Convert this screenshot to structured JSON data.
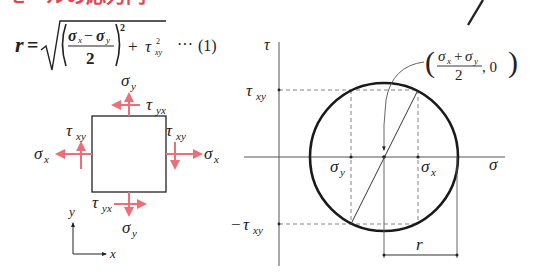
{
  "heading": {
    "text": "モールの応力円",
    "color": "#e0474f",
    "cropped": true
  },
  "formula": {
    "lhs": "r",
    "equals": "=",
    "numerator_a": "σ",
    "numerator_a_sub": "x",
    "minus": "−",
    "numerator_b": "σ",
    "numerator_b_sub": "y",
    "denominator": "2",
    "exponent": "2",
    "plus": "+",
    "tau": "τ",
    "tau_sub": "xy",
    "tau_exp": "2",
    "dots": "···",
    "number": "(1)"
  },
  "stress_element": {
    "arrow_color": "#ec6f78",
    "labels": {
      "top_normal": {
        "sym": "σ",
        "sub": "y"
      },
      "top_shear": {
        "sym": "τ",
        "sub": "yx"
      },
      "left_shear": {
        "sym": "τ",
        "sub": "xy"
      },
      "left_normal": {
        "sym": "σ",
        "sub": "x"
      },
      "right_shear": {
        "sym": "τ",
        "sub": "xy"
      },
      "right_normal": {
        "sym": "σ",
        "sub": "x"
      },
      "bottom_shear": {
        "sym": "τ",
        "sub": "yx"
      },
      "bottom_normal": {
        "sym": "σ",
        "sub": "y"
      }
    },
    "axes": {
      "y_label": "y",
      "x_label": "x"
    }
  },
  "mohr_circle": {
    "axis_labels": {
      "vertical": "τ",
      "horizontal": "σ"
    },
    "tick_labels": {
      "tau_pos": {
        "sym": "τ",
        "sub": "xy"
      },
      "tau_neg": {
        "prefix": "−",
        "sym": "τ",
        "sub": "xy"
      },
      "sigma_y": {
        "sym": "σ",
        "sub": "y"
      },
      "sigma_x": {
        "sym": "σ",
        "sub": "x"
      }
    },
    "center_label": {
      "open": "(",
      "num_a": "σ",
      "num_a_sub": "x",
      "plus": "+",
      "num_b": "σ",
      "num_b_sub": "y",
      "den": "2",
      "comma_zero": ", 0",
      "close": ")"
    },
    "radius_label": "r"
  }
}
